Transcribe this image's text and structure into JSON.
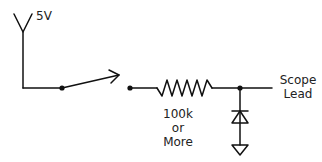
{
  "diagram": {
    "type": "circuit-schematic",
    "stroke_color": "#111111",
    "labels": {
      "supply": "5V",
      "resistor_line1": "100k",
      "resistor_line2": "or",
      "resistor_line3": "More",
      "output_line1": "Scope",
      "output_line2": "Lead"
    },
    "components": [
      {
        "name": "supply",
        "symbol": "antenna-v",
        "value": "5V"
      },
      {
        "name": "switch",
        "symbol": "spst-switch"
      },
      {
        "name": "resistor",
        "symbol": "zigzag",
        "value": "100k or More"
      },
      {
        "name": "diode",
        "symbol": "diode-to-ground"
      },
      {
        "name": "ground",
        "symbol": "ground-triangle"
      },
      {
        "name": "output",
        "symbol": "terminal",
        "value": "Scope Lead"
      }
    ]
  }
}
